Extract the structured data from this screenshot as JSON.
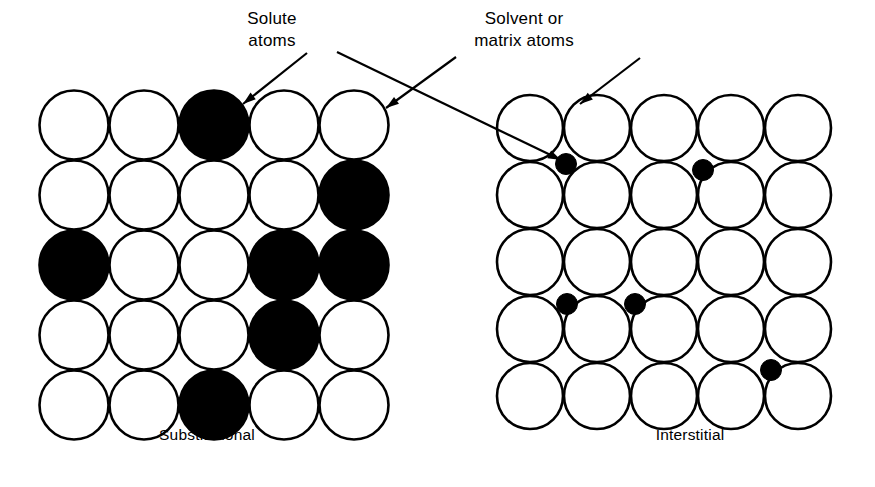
{
  "figure": {
    "width": 875,
    "height": 487,
    "background_color": "#ffffff",
    "stroke_color": "#000000",
    "solute_color": "#000000",
    "host_color": "#ffffff"
  },
  "labels": {
    "solute": {
      "line1": "Solute",
      "line2": "atoms"
    },
    "solvent": {
      "line1": "Solvent or",
      "line2": "matrix atoms"
    }
  },
  "captions": {
    "left": "Substitutional",
    "right": "Interstitial"
  },
  "diagrams": [
    {
      "id": "substitutional",
      "caption": "Substitutional",
      "caption_x": 207,
      "caption_y": 440,
      "rows": 5,
      "cols": 5,
      "origin_x": 74,
      "origin_y": 125,
      "pitch_x": 70,
      "pitch_y": 70,
      "radius": 34.5,
      "description": "Square lattice of equal-size atoms; solute atoms replace host atoms on lattice sites.",
      "solute_sites": [
        {
          "row": 1,
          "col": 3
        },
        {
          "row": 2,
          "col": 5
        },
        {
          "row": 3,
          "col": 1
        },
        {
          "row": 3,
          "col": 4
        },
        {
          "row": 3,
          "col": 5
        },
        {
          "row": 4,
          "col": 4
        },
        {
          "row": 5,
          "col": 3
        }
      ]
    },
    {
      "id": "interstitial",
      "caption": "Interstitial",
      "caption_x": 690,
      "caption_y": 440,
      "rows": 5,
      "cols": 5,
      "origin_x": 530,
      "origin_y": 128,
      "pitch_x": 67,
      "pitch_y": 67,
      "radius": 33,
      "description": "Square lattice of host atoms; small solute atoms occupy interstices between host atoms.",
      "interstitial_radius": 10.5,
      "interstitial_sites": [
        {
          "gap_col": 1,
          "gap_row": 1,
          "cx": 566,
          "cy": 164
        },
        {
          "gap_col": 3,
          "gap_row": 1,
          "cx": 703,
          "cy": 170
        },
        {
          "gap_col": 1,
          "gap_row": 3,
          "cx": 567,
          "cy": 304
        },
        {
          "gap_col": 2,
          "gap_row": 3,
          "cx": 635,
          "cy": 304
        },
        {
          "gap_col": 4,
          "gap_row": 4,
          "cx": 771,
          "cy": 370
        }
      ]
    }
  ],
  "callouts": [
    {
      "id": "solute-to-substitutional",
      "label": "Solute atoms",
      "text_x": 272,
      "text_y1": 24,
      "text_y2": 46,
      "line": {
        "x1": 307,
        "y1": 53,
        "x2": 243,
        "y2": 104
      },
      "arrow_angle_deg": 141,
      "target": "black atom in substitutional lattice row 1 col 3"
    },
    {
      "id": "solute-to-interstitial",
      "label": "Solute atoms",
      "line": {
        "x1": 337,
        "y1": 52,
        "x2": 561,
        "y2": 160
      },
      "arrow_angle_deg": 26,
      "target": "small black interstitial atom in interstitial lattice"
    },
    {
      "id": "solvent-to-substitutional",
      "label": "Solvent or matrix atoms",
      "text_x": 524,
      "text_y1": 24,
      "text_y2": 46,
      "line": {
        "x1": 456,
        "y1": 57,
        "x2": 386,
        "y2": 108
      },
      "arrow_angle_deg": 144,
      "target": "white host atom in substitutional lattice row 1 col 5"
    },
    {
      "id": "solvent-to-interstitial",
      "label": "Solvent or matrix atoms",
      "line": {
        "x1": 640,
        "y1": 58,
        "x2": 580,
        "y2": 104
      },
      "arrow_angle_deg": 142,
      "target": "white host atom in interstitial lattice row 1 col 2"
    }
  ]
}
